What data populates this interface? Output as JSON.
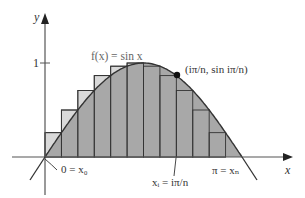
{
  "figure": {
    "y_axis_label": "y",
    "x_axis_label": "x",
    "y_tick_label": "1",
    "function_label": "f(x) = sin x",
    "point_label": "(iπ/n, sin iπ/n)",
    "origin_label": "0 = x₀",
    "xi_label": "xᵢ = iπ/n",
    "end_label": "π = xₙ"
  },
  "colors": {
    "rect_fill": "#a8a8a8",
    "upper_fill": "#d9d9d9",
    "stroke": "#333333",
    "curve": "#333333",
    "label_gray": "#555555"
  },
  "chart_data": {
    "type": "area",
    "title": "",
    "function": "sin x",
    "n": 12,
    "xlim": [
      0,
      3.14159
    ],
    "ylim": [
      0,
      1
    ],
    "x": [
      0.262,
      0.524,
      0.785,
      1.047,
      1.309,
      1.571,
      1.833,
      2.094,
      2.356,
      2.618,
      2.88,
      3.142
    ],
    "values": [
      0.259,
      0.5,
      0.707,
      0.866,
      0.966,
      1.0,
      0.966,
      0.866,
      0.707,
      0.5,
      0.259,
      0.0
    ],
    "annotations": [
      "f(x) = sin x",
      "(iπ/n, sin iπ/n)",
      "0 = x₀",
      "xᵢ = iπ/n",
      "π = xₙ"
    ],
    "xlabel": "x",
    "ylabel": "y",
    "grid": false
  }
}
